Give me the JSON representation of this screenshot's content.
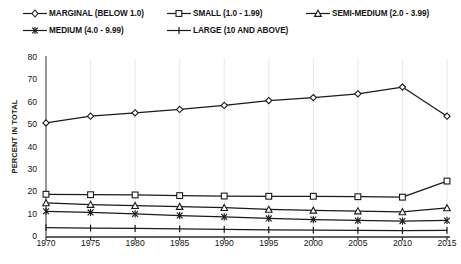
{
  "chart_data": {
    "type": "line",
    "title": "",
    "xlabel": "",
    "ylabel": "PERCENT IN TOTAL",
    "x": [
      1970,
      1975,
      1980,
      1985,
      1990,
      1995,
      2000,
      2005,
      2010,
      2015
    ],
    "xtick_labels": [
      "1970",
      "1975",
      "1980",
      "1985",
      "1990",
      "1995",
      "2000",
      "2005",
      "2010",
      "2015"
    ],
    "ytick_labels": [
      "0",
      "10",
      "20",
      "30",
      "40",
      "50",
      "60",
      "70",
      "80"
    ],
    "yticks": [
      0,
      10,
      20,
      30,
      40,
      50,
      60,
      70,
      80
    ],
    "ylim": [
      0,
      80
    ],
    "grid": "vertical",
    "legend_position": "top",
    "series": [
      {
        "name": "MARGINAL (BELOW 1.0)",
        "marker": "diamond",
        "values": [
          51.0,
          54.0,
          55.5,
          57.0,
          58.8,
          61.0,
          62.3,
          64.0,
          67.0,
          54.0
        ]
      },
      {
        "name": "SMALL (1.0 - 1.99)",
        "marker": "square",
        "values": [
          19.1,
          18.9,
          18.8,
          18.5,
          18.3,
          18.2,
          18.2,
          18.0,
          17.8,
          25.0
        ]
      },
      {
        "name": "SEMI-MEDIUM (2.0 - 3.99)",
        "marker": "triangle",
        "values": [
          15.2,
          14.5,
          14.0,
          13.6,
          13.1,
          12.3,
          11.9,
          11.6,
          11.2,
          13.0
        ]
      },
      {
        "name": "MEDIUM (4.0 - 9.99)",
        "marker": "asterisk",
        "values": [
          11.5,
          11.0,
          10.3,
          9.6,
          9.0,
          8.3,
          7.8,
          7.4,
          7.1,
          7.4
        ]
      },
      {
        "name": "LARGE (10 AND ABOVE)",
        "marker": "plus",
        "values": [
          4.2,
          4.0,
          3.8,
          3.6,
          3.4,
          3.2,
          3.1,
          3.0,
          2.9,
          3.0
        ]
      }
    ]
  },
  "legend": {
    "items": [
      {
        "label": "MARGINAL (BELOW 1.0)",
        "marker": "diamond"
      },
      {
        "label": "SMALL (1.0 - 1.99)",
        "marker": "square"
      },
      {
        "label": "SEMI-MEDIUM (2.0 - 3.99)",
        "marker": "triangle"
      },
      {
        "label": "MEDIUM (4.0 - 9.99)",
        "marker": "asterisk"
      },
      {
        "label": "LARGE (10 AND ABOVE)",
        "marker": "plus"
      }
    ]
  },
  "colors": {
    "line": "#1a1a1a",
    "grid": "#e9e9e9",
    "axis": "#4a4a4a",
    "text": "#141414",
    "background": "#ffffff"
  }
}
